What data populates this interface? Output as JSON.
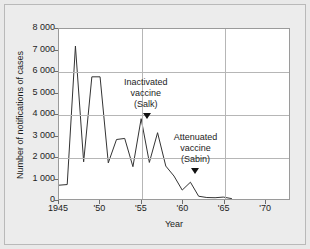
{
  "figure": {
    "background_color": "#e9e9e9",
    "plot_background_color": "#ffffff",
    "line_color": "#333333"
  },
  "chart_data": {
    "type": "line",
    "title": "",
    "xlabel": "Year",
    "ylabel": "Number of notifications of cases",
    "xlim": [
      1945,
      1973
    ],
    "ylim": [
      0,
      8000
    ],
    "grid": "horizontal and vertical gridlines",
    "legend": "none",
    "ytick_labels": [
      "0",
      "1 000",
      "2 000",
      "3 000",
      "4 000",
      "5 000",
      "6 000",
      "7 000",
      "8 000"
    ],
    "ytick_values": [
      0,
      1000,
      2000,
      3000,
      4000,
      5000,
      6000,
      7000,
      8000
    ],
    "xtick_labels": [
      "1945",
      "'50",
      "'55",
      "'60",
      "'65",
      "'70"
    ],
    "xtick_values": [
      1945,
      1950,
      1955,
      1960,
      1965,
      1970
    ],
    "gridline_x_values": [
      1955,
      1965
    ],
    "gridline_y_values": [
      2000,
      4000,
      6000,
      8000
    ],
    "x": [
      1945,
      1946,
      1947,
      1948,
      1949,
      1950,
      1951,
      1952,
      1953,
      1954,
      1955,
      1956,
      1957,
      1958,
      1959,
      1960,
      1961,
      1962,
      1963,
      1964,
      1965,
      1966
    ],
    "values": [
      650,
      680,
      7200,
      1750,
      5750,
      5750,
      1700,
      2800,
      2850,
      1520,
      3780,
      1720,
      3120,
      1550,
      1080,
      420,
      790,
      130,
      70,
      60,
      90,
      20
    ],
    "series": [
      {
        "name": "Poliomyelitis notifications",
        "values": [
          650,
          680,
          7200,
          1750,
          5750,
          5750,
          1700,
          2800,
          2850,
          1520,
          3780,
          1720,
          3120,
          1550,
          1080,
          420,
          790,
          130,
          70,
          60,
          90,
          20
        ]
      }
    ],
    "annotations": [
      {
        "id": "salk",
        "lines": [
          "Inactivated",
          "vaccine",
          "(Salk)"
        ],
        "text_x": 1955.6,
        "text_y": 5700,
        "marker_x": 1955.7,
        "marker_y": 4050
      },
      {
        "id": "sabin",
        "lines": [
          "Attenuated",
          "vaccine",
          "(Sabin)"
        ],
        "text_x": 1961.6,
        "text_y": 3150,
        "marker_x": 1961.5,
        "marker_y": 1500
      }
    ]
  }
}
